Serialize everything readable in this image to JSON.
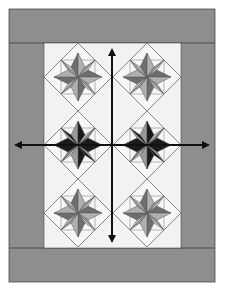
{
  "diagram": {
    "title": "",
    "layout": {
      "columns": 2,
      "rows": 3
    },
    "colors": {
      "background": "#ffffff",
      "border": "#8e8e8e",
      "border_line": "#4a4a4a",
      "center_panel": "#f2f2f2",
      "block_outline": "#6a6a6a",
      "star_dark": "#1a1a1a",
      "star_medium_dark": "#6e6e6e",
      "star_medium": "#9a9a9a",
      "star_light": "#c4c4c4",
      "background_triangle": "#f7f7f7",
      "arrow": "#111111"
    },
    "blocks": [
      {
        "row": 1,
        "col": 1,
        "style": "gray"
      },
      {
        "row": 1,
        "col": 2,
        "style": "gray"
      },
      {
        "row": 2,
        "col": 1,
        "style": "dark"
      },
      {
        "row": 2,
        "col": 2,
        "style": "dark"
      },
      {
        "row": 3,
        "col": 1,
        "style": "gray"
      },
      {
        "row": 3,
        "col": 2,
        "style": "gray"
      }
    ],
    "arrows": [
      {
        "orientation": "vertical",
        "label": ""
      },
      {
        "orientation": "horizontal",
        "label": ""
      }
    ]
  }
}
